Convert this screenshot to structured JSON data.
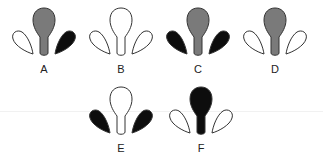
{
  "colors": {
    "white": "#ffffff",
    "gray": "#7a7a7a",
    "black": "#0d0d0d",
    "stroke": "#333333"
  },
  "figures": [
    {
      "label": "A",
      "left": "white",
      "center": "gray",
      "right": "black",
      "x": 9,
      "y": 7
    },
    {
      "label": "B",
      "left": "white",
      "center": "white",
      "right": "white",
      "x": 86,
      "y": 7
    },
    {
      "label": "C",
      "left": "black",
      "center": "gray",
      "right": "black",
      "x": 163,
      "y": 7
    },
    {
      "label": "D",
      "left": "white",
      "center": "gray",
      "right": "white",
      "x": 240,
      "y": 7
    },
    {
      "label": "E",
      "left": "black",
      "center": "white",
      "right": "black",
      "x": 86,
      "y": 86
    },
    {
      "label": "F",
      "left": "white",
      "center": "black",
      "right": "white",
      "x": 166,
      "y": 86
    }
  ]
}
